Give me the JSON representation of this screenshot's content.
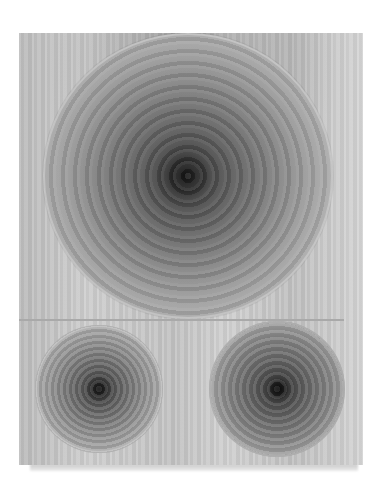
{
  "artwork": {
    "subject": "Painting of concentric circles",
    "description": "Grayscale canvas with one large concentric-circle disc on top and two smaller concentric-circle discs below, separated by a horizontal line",
    "palette": {
      "background": "#ffffff",
      "canvas": "#c6c6c6",
      "circle_center": "#141414",
      "circle_rim": "#c9c9c9",
      "divider": "#a9a9a9"
    },
    "elements": [
      {
        "name": "large-circle",
        "position": "top"
      },
      {
        "name": "small-circle-left",
        "position": "bottom-left"
      },
      {
        "name": "small-circle-right",
        "position": "bottom-right"
      }
    ]
  }
}
